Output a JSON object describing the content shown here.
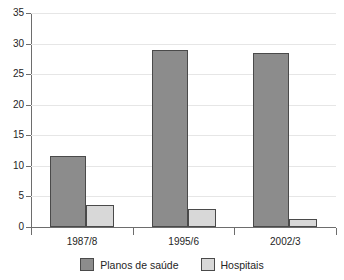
{
  "chart_data": {
    "type": "bar",
    "title": "",
    "subtitle": "",
    "xlabel": "",
    "ylabel": "",
    "categories": [
      "1987/8",
      "1995/6",
      "2002/3"
    ],
    "series": [
      {
        "name": "Planos de saúde",
        "values": [
          11.6,
          29.0,
          28.5
        ],
        "color": "#8c8c8c"
      },
      {
        "name": "Hospitais",
        "values": [
          3.6,
          2.9,
          1.3
        ],
        "color": "#d8d8d8"
      }
    ],
    "ylim": [
      0,
      35
    ],
    "ytick_labels": [
      "0",
      "5",
      "10",
      "15",
      "20",
      "25",
      "30",
      "35"
    ],
    "ytick_values": [
      0,
      5,
      10,
      15,
      20,
      25,
      30,
      35
    ],
    "grid": true,
    "grid_color": "#e6e6e6",
    "legend_position": "bottom",
    "axis_color": "#6d6d6d",
    "bar_border_color": "#4a4a4a",
    "background": "#ffffff"
  },
  "legend": {
    "entries": [
      {
        "label": "Planos de saúde"
      },
      {
        "label": "Hospitais"
      }
    ]
  }
}
